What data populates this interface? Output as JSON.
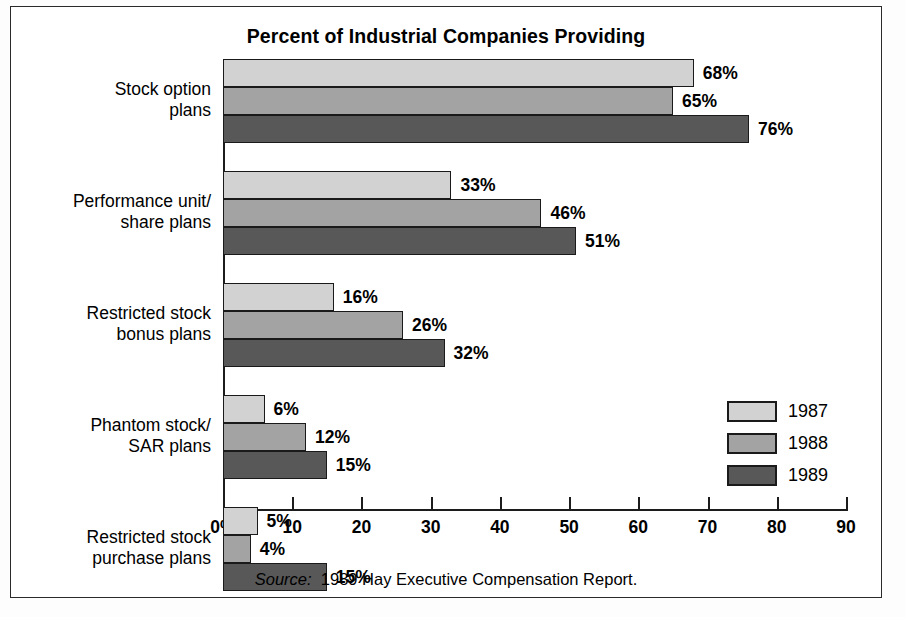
{
  "chart_data": {
    "type": "bar",
    "orientation": "horizontal",
    "title": "Percent of Industrial Companies Providing",
    "xlabel": "",
    "ylabel": "",
    "xlim": [
      0,
      90
    ],
    "grid": false,
    "legend_position": "right-bottom",
    "categories": [
      "Stock option\nplans",
      "Performance unit/\nshare plans",
      "Restricted stock\nbonus plans",
      "Phantom stock/\nSAR plans",
      "Restricted stock\npurchase plans"
    ],
    "series": [
      {
        "name": "1987",
        "color": "#d2d2d2",
        "values": [
          68,
          33,
          16,
          6,
          5
        ]
      },
      {
        "name": "1988",
        "color": "#a3a3a3",
        "values": [
          65,
          46,
          26,
          12,
          4
        ]
      },
      {
        "name": "1989",
        "color": "#585858",
        "values": [
          76,
          51,
          32,
          15,
          15
        ]
      }
    ],
    "value_labels": [
      [
        "68%",
        "65%",
        "76%"
      ],
      [
        "33%",
        "46%",
        "51%"
      ],
      [
        "16%",
        "26%",
        "32%"
      ],
      [
        "6%",
        "12%",
        "15%"
      ],
      [
        "5%",
        "4%",
        "15%"
      ]
    ],
    "xticks": [
      0,
      10,
      20,
      30,
      40,
      50,
      60,
      70,
      80,
      90
    ],
    "xtick_labels": [
      "0%",
      "10",
      "20",
      "30",
      "40",
      "50",
      "60",
      "70",
      "80",
      "90"
    ]
  },
  "legend": {
    "entries": [
      {
        "label": "1987"
      },
      {
        "label": "1988"
      },
      {
        "label": "1989"
      }
    ]
  },
  "source": {
    "prefix": "Source:",
    "text": "1989 Hay Executive Compensation Report."
  }
}
